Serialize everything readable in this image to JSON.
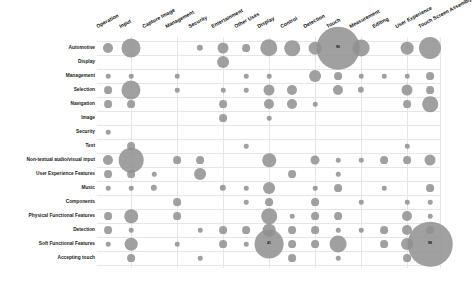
{
  "chart_data": {
    "type": "scatter",
    "subtype": "bubble-matrix",
    "title": "",
    "xlabel": "",
    "ylabel": "",
    "grid": true,
    "legend": "none",
    "x_categories": [
      "Operation",
      "Input",
      "Capture Image",
      "Management",
      "Security",
      "Entertainment",
      "Other Uses",
      "Display",
      "Control",
      "Detection",
      "Touch",
      "Measurement",
      "Editing",
      "User Experience",
      "Touch Screen Assembly"
    ],
    "y_categories": [
      "Automotive",
      "Display",
      "Management",
      "Selection",
      "Navigation",
      "Image",
      "Security",
      "Text",
      "Non-textual audio/visual input",
      "User Experience Features",
      "Music",
      "Components",
      "Physical Functional Features",
      "Detection",
      "Soft Functional Features",
      "Accepting touch"
    ],
    "labeled_values": [
      {
        "row": "Automotive",
        "col": "Touch",
        "value": 90
      },
      {
        "row": "Soft Functional Features",
        "col": "Display",
        "value": 41
      },
      {
        "row": "Soft Functional Features",
        "col": "Touch Screen Assembly",
        "value": 98
      }
    ],
    "points": [
      {
        "r": 0,
        "c": 0,
        "v": 5
      },
      {
        "r": 0,
        "c": 1,
        "v": 18
      },
      {
        "r": 0,
        "c": 4,
        "v": 2
      },
      {
        "r": 0,
        "c": 5,
        "v": 6
      },
      {
        "r": 0,
        "c": 6,
        "v": 3
      },
      {
        "r": 0,
        "c": 7,
        "v": 15
      },
      {
        "r": 0,
        "c": 8,
        "v": 12
      },
      {
        "r": 0,
        "c": 9,
        "v": 8
      },
      {
        "r": 0,
        "c": 10,
        "v": 90
      },
      {
        "r": 0,
        "c": 11,
        "v": 14
      },
      {
        "r": 0,
        "c": 13,
        "v": 8
      },
      {
        "r": 0,
        "c": 14,
        "v": 24
      },
      {
        "r": 1,
        "c": 5,
        "v": 7
      },
      {
        "r": 2,
        "c": 0,
        "v": 1
      },
      {
        "r": 2,
        "c": 1,
        "v": 1
      },
      {
        "r": 2,
        "c": 3,
        "v": 1
      },
      {
        "r": 2,
        "c": 6,
        "v": 1
      },
      {
        "r": 2,
        "c": 7,
        "v": 1
      },
      {
        "r": 2,
        "c": 9,
        "v": 7
      },
      {
        "r": 2,
        "c": 10,
        "v": 3
      },
      {
        "r": 2,
        "c": 11,
        "v": 1
      },
      {
        "r": 2,
        "c": 12,
        "v": 1
      },
      {
        "r": 2,
        "c": 13,
        "v": 1
      },
      {
        "r": 2,
        "c": 14,
        "v": 3
      },
      {
        "r": 3,
        "c": 0,
        "v": 3
      },
      {
        "r": 3,
        "c": 1,
        "v": 18
      },
      {
        "r": 3,
        "c": 3,
        "v": 1
      },
      {
        "r": 3,
        "c": 5,
        "v": 1
      },
      {
        "r": 3,
        "c": 6,
        "v": 1
      },
      {
        "r": 3,
        "c": 7,
        "v": 6
      },
      {
        "r": 3,
        "c": 8,
        "v": 5
      },
      {
        "r": 3,
        "c": 10,
        "v": 5
      },
      {
        "r": 3,
        "c": 11,
        "v": 2
      },
      {
        "r": 3,
        "c": 13,
        "v": 6
      },
      {
        "r": 3,
        "c": 14,
        "v": 3
      },
      {
        "r": 4,
        "c": 0,
        "v": 3
      },
      {
        "r": 4,
        "c": 1,
        "v": 3
      },
      {
        "r": 4,
        "c": 5,
        "v": 3
      },
      {
        "r": 4,
        "c": 7,
        "v": 5
      },
      {
        "r": 4,
        "c": 8,
        "v": 5
      },
      {
        "r": 4,
        "c": 9,
        "v": 1
      },
      {
        "r": 4,
        "c": 13,
        "v": 3
      },
      {
        "r": 4,
        "c": 14,
        "v": 12
      },
      {
        "r": 5,
        "c": 5,
        "v": 3
      },
      {
        "r": 5,
        "c": 7,
        "v": 1
      },
      {
        "r": 6,
        "c": 0,
        "v": 1
      },
      {
        "r": 7,
        "c": 1,
        "v": 3
      },
      {
        "r": 7,
        "c": 6,
        "v": 1
      },
      {
        "r": 7,
        "c": 13,
        "v": 1
      },
      {
        "r": 8,
        "c": 0,
        "v": 5
      },
      {
        "r": 8,
        "c": 1,
        "v": 30
      },
      {
        "r": 8,
        "c": 3,
        "v": 3
      },
      {
        "r": 8,
        "c": 4,
        "v": 3
      },
      {
        "r": 8,
        "c": 7,
        "v": 9
      },
      {
        "r": 8,
        "c": 9,
        "v": 4
      },
      {
        "r": 8,
        "c": 10,
        "v": 1
      },
      {
        "r": 8,
        "c": 11,
        "v": 1
      },
      {
        "r": 8,
        "c": 12,
        "v": 3
      },
      {
        "r": 8,
        "c": 13,
        "v": 3
      },
      {
        "r": 8,
        "c": 14,
        "v": 6
      },
      {
        "r": 9,
        "c": 0,
        "v": 3
      },
      {
        "r": 9,
        "c": 1,
        "v": 3
      },
      {
        "r": 9,
        "c": 2,
        "v": 1
      },
      {
        "r": 9,
        "c": 4,
        "v": 7
      },
      {
        "r": 9,
        "c": 8,
        "v": 3
      },
      {
        "r": 9,
        "c": 10,
        "v": 1
      },
      {
        "r": 10,
        "c": 0,
        "v": 1
      },
      {
        "r": 10,
        "c": 1,
        "v": 1
      },
      {
        "r": 10,
        "c": 2,
        "v": 2
      },
      {
        "r": 10,
        "c": 5,
        "v": 2
      },
      {
        "r": 10,
        "c": 6,
        "v": 1
      },
      {
        "r": 10,
        "c": 7,
        "v": 7
      },
      {
        "r": 10,
        "c": 9,
        "v": 1
      },
      {
        "r": 10,
        "c": 10,
        "v": 3
      },
      {
        "r": 10,
        "c": 12,
        "v": 1
      },
      {
        "r": 10,
        "c": 14,
        "v": 3
      },
      {
        "r": 11,
        "c": 3,
        "v": 3
      },
      {
        "r": 11,
        "c": 6,
        "v": 1
      },
      {
        "r": 11,
        "c": 7,
        "v": 3
      },
      {
        "r": 11,
        "c": 9,
        "v": 3
      },
      {
        "r": 11,
        "c": 11,
        "v": 1
      },
      {
        "r": 11,
        "c": 13,
        "v": 1
      },
      {
        "r": 11,
        "c": 14,
        "v": 1
      },
      {
        "r": 12,
        "c": 0,
        "v": 3
      },
      {
        "r": 12,
        "c": 1,
        "v": 9
      },
      {
        "r": 12,
        "c": 3,
        "v": 3
      },
      {
        "r": 12,
        "c": 7,
        "v": 12
      },
      {
        "r": 12,
        "c": 8,
        "v": 1
      },
      {
        "r": 12,
        "c": 9,
        "v": 3
      },
      {
        "r": 12,
        "c": 10,
        "v": 3
      },
      {
        "r": 12,
        "c": 13,
        "v": 5
      },
      {
        "r": 12,
        "c": 14,
        "v": 1
      },
      {
        "r": 13,
        "c": 0,
        "v": 3
      },
      {
        "r": 13,
        "c": 1,
        "v": 1
      },
      {
        "r": 13,
        "c": 4,
        "v": 1
      },
      {
        "r": 13,
        "c": 5,
        "v": 3
      },
      {
        "r": 13,
        "c": 6,
        "v": 3
      },
      {
        "r": 13,
        "c": 7,
        "v": 8
      },
      {
        "r": 13,
        "c": 8,
        "v": 3
      },
      {
        "r": 13,
        "c": 9,
        "v": 3
      },
      {
        "r": 13,
        "c": 10,
        "v": 1
      },
      {
        "r": 13,
        "c": 11,
        "v": 1
      },
      {
        "r": 13,
        "c": 12,
        "v": 3
      },
      {
        "r": 13,
        "c": 13,
        "v": 5
      },
      {
        "r": 13,
        "c": 14,
        "v": 3
      },
      {
        "r": 14,
        "c": 0,
        "v": 1
      },
      {
        "r": 14,
        "c": 1,
        "v": 8
      },
      {
        "r": 14,
        "c": 3,
        "v": 1
      },
      {
        "r": 14,
        "c": 5,
        "v": 3
      },
      {
        "r": 14,
        "c": 6,
        "v": 1
      },
      {
        "r": 14,
        "c": 7,
        "v": 41
      },
      {
        "r": 14,
        "c": 8,
        "v": 3
      },
      {
        "r": 14,
        "c": 9,
        "v": 3
      },
      {
        "r": 14,
        "c": 10,
        "v": 14
      },
      {
        "r": 14,
        "c": 12,
        "v": 3
      },
      {
        "r": 14,
        "c": 13,
        "v": 7
      },
      {
        "r": 14,
        "c": 14,
        "v": 98
      },
      {
        "r": 15,
        "c": 1,
        "v": 3
      },
      {
        "r": 15,
        "c": 4,
        "v": 1
      },
      {
        "r": 15,
        "c": 8,
        "v": 3
      },
      {
        "r": 15,
        "c": 10,
        "v": 1
      },
      {
        "r": 15,
        "c": 13,
        "v": 3
      }
    ]
  },
  "layout": {
    "col_x0": 108,
    "col_dx": 23,
    "row_y0": 48,
    "row_dy": 14,
    "grid_left": 97,
    "grid_right": 440,
    "grid_top": 37,
    "grid_bottom": 268
  }
}
